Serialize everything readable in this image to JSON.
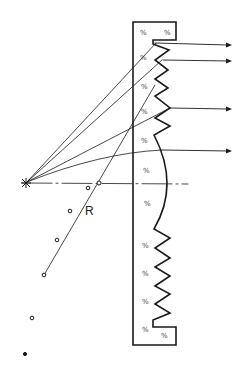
{
  "diagram": {
    "type": "fresnel-lens-cross-section",
    "labels": {
      "radius": "R"
    },
    "hatch_mark": "%",
    "colors": {
      "ink": "#1a1a1a",
      "background": "#ffffff"
    },
    "focal_point": {
      "x": 25,
      "y": 182
    },
    "optical_axis_y": 182,
    "rays": [
      {
        "to_x": 153,
        "to_y": 43,
        "exit_y": 43
      },
      {
        "to_x": 163,
        "to_y": 60,
        "exit_y": 60
      },
      {
        "to_x": 153,
        "to_y": 86
      },
      {
        "to_x": 170,
        "to_y": 108,
        "exit_y": 108
      },
      {
        "to_x": 162,
        "to_y": 150,
        "exit_y": 150
      }
    ],
    "center_points": [
      {
        "x": 98,
        "y": 183
      },
      {
        "x": 88,
        "y": 188
      },
      {
        "x": 70,
        "y": 211
      },
      {
        "x": 57,
        "y": 240
      },
      {
        "x": 44,
        "y": 275
      },
      {
        "x": 32,
        "y": 318
      },
      {
        "x": 25,
        "y": 354
      }
    ]
  }
}
